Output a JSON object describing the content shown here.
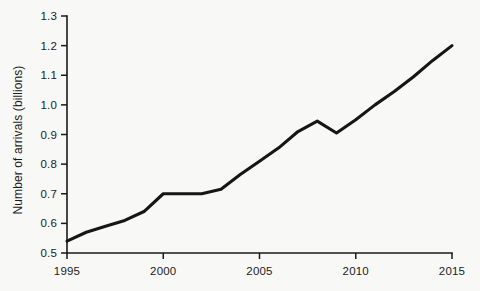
{
  "chart_data": {
    "type": "line",
    "title": "",
    "xlabel": "",
    "ylabel": "Number of arrivals (billions)",
    "xlim": [
      1995,
      2015
    ],
    "ylim": [
      0.5,
      1.3
    ],
    "grid": false,
    "legend": false,
    "x_ticks": [
      "1995",
      "2000",
      "2005",
      "2010",
      "2015"
    ],
    "x_tick_values": [
      1995,
      2000,
      2005,
      2010,
      2015
    ],
    "y_ticks": [
      "0.5",
      "0.6",
      "0.7",
      "0.8",
      "0.9",
      "1.0",
      "1.1",
      "1.2",
      "1.3"
    ],
    "y_tick_values": [
      0.5,
      0.6,
      0.7,
      0.8,
      0.9,
      1.0,
      1.1,
      1.2,
      1.3
    ],
    "line_color": "#161616",
    "background_color": "#f8f8f7",
    "x": [
      1995,
      1996,
      1997,
      1998,
      1999,
      2000,
      2001,
      2002,
      2003,
      2004,
      2005,
      2006,
      2007,
      2008,
      2009,
      2010,
      2011,
      2012,
      2013,
      2014,
      2015
    ],
    "series": [
      {
        "name": "International tourist arrivals",
        "values": [
          0.54,
          0.57,
          0.59,
          0.61,
          0.64,
          0.7,
          0.7,
          0.7,
          0.715,
          0.765,
          0.81,
          0.855,
          0.91,
          0.945,
          0.905,
          0.95,
          1.0,
          1.045,
          1.095,
          1.15,
          1.2
        ]
      }
    ]
  },
  "axis": {
    "y_title": "Number of arrivals (billions)"
  }
}
